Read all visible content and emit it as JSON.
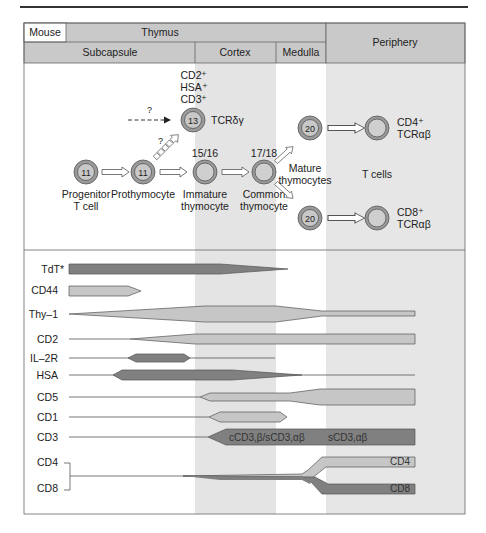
{
  "header": {
    "species": "Mouse",
    "organ": "Thymus",
    "regions": [
      "Subcapsule",
      "Cortex",
      "Medulla"
    ],
    "periphery": "Periphery"
  },
  "cells": {
    "progenitor": {
      "number": "11",
      "label1": "Progenitor",
      "label2": "T cell"
    },
    "prothymocyte": {
      "number": "11",
      "label1": "Prothymocyte"
    },
    "tcr_gd": {
      "number": "13",
      "label": "TCRδγ",
      "markers": [
        "CD2⁺",
        "HSA⁺",
        "CD3⁺"
      ]
    },
    "immature": {
      "stage": "15/16",
      "label1": "Immature",
      "label2": "thymocyte"
    },
    "common": {
      "stage": "17/18",
      "label1": "Common",
      "label2": "thymocyte"
    },
    "mature_top": {
      "number": "20"
    },
    "mature_bottom": {
      "number": "20"
    },
    "mature_label1": "Mature",
    "mature_label2": "thymocytes",
    "tcells_label": "T cells",
    "cd4_out": {
      "l1": "CD4⁺",
      "l2": "TCRαβ"
    },
    "cd8_out": {
      "l1": "CD8⁺",
      "l2": "TCRαβ"
    },
    "question": "?"
  },
  "markers": {
    "rows": [
      "TdT*",
      "CD44",
      "Thy–1",
      "CD2",
      "IL–2R",
      "HSA",
      "CD5",
      "CD1",
      "CD3",
      "CD4",
      "CD8"
    ],
    "cd3_label_a": "cCD3,β/sCD3,αβ",
    "cd3_label_b": "sCD3,αβ",
    "cd4_bar": "CD4",
    "cd8_bar": "CD8"
  },
  "colors": {
    "header": "#c9c9c9",
    "cortex": "#e4e4e4",
    "periphery": "#e6e6e6",
    "dark_bar": "#808080",
    "light_bar": "#c6c6c6",
    "cell_ring": "#9a9a9a",
    "cell_core": "#c8c8c8"
  }
}
